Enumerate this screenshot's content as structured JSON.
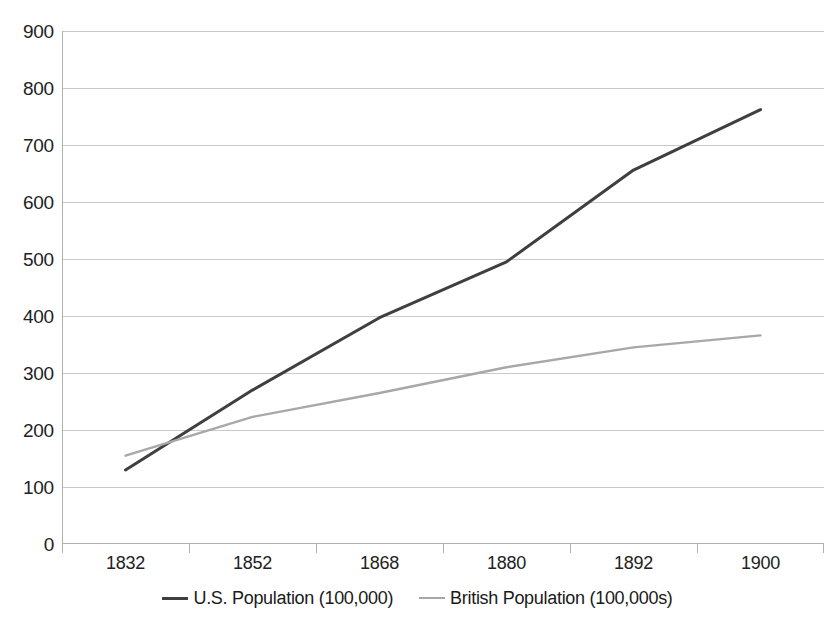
{
  "chart": {
    "type": "line",
    "title": "",
    "width": 835,
    "height": 626
  },
  "axes": {
    "y": {
      "min": 0,
      "max": 900,
      "step": 100,
      "ticks": [
        "900",
        "800",
        "700",
        "600",
        "500",
        "400",
        "300",
        "200",
        "100",
        "0"
      ],
      "label": ""
    },
    "x": {
      "ticks": [
        "1832",
        "1852",
        "1868",
        "1880",
        "1892",
        "1900"
      ],
      "label": ""
    }
  },
  "legend": {
    "position": "bottom",
    "items": [
      {
        "label": "U.S. Population (100,000)",
        "color": "#3f3f3f",
        "style": "solid"
      },
      {
        "label": "British Population (100,000s)",
        "color": "#a8a8a8",
        "style": "solid-light"
      }
    ]
  },
  "colors": {
    "us_line": "#3f3f3f",
    "british_line": "#a8a8a8",
    "gridline": "#c9c9c9",
    "axis": "#b0b0b0",
    "text": "#1a1a1a",
    "background": "#ffffff"
  },
  "chart_data": {
    "type": "line",
    "title": "",
    "xlabel": "",
    "ylabel": "",
    "ylim": [
      0,
      900
    ],
    "grid": true,
    "legend_position": "bottom",
    "categories": [
      "1832",
      "1852",
      "1868",
      "1880",
      "1892",
      "1900"
    ],
    "series": [
      {
        "name": "U.S. Population (100,000)",
        "color": "#3f3f3f",
        "values": [
          130,
          270,
          397,
          495,
          656,
          762
        ]
      },
      {
        "name": "British Population (100,000s)",
        "color": "#a8a8a8",
        "values": [
          155,
          223,
          265,
          310,
          345,
          366
        ]
      }
    ]
  }
}
